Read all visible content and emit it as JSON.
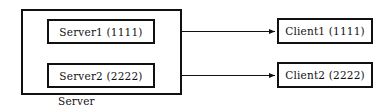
{
  "diagram": {
    "server_group": {
      "label": "Server",
      "nodes": [
        {
          "id": "server1",
          "label": "Server1 (1111)",
          "name": "Server1",
          "port": "1111"
        },
        {
          "id": "server2",
          "label": "Server2 (2222)",
          "name": "Server2",
          "port": "2222"
        }
      ]
    },
    "clients": [
      {
        "id": "client1",
        "label": "Client1 (1111)",
        "name": "Client1",
        "port": "1111"
      },
      {
        "id": "client2",
        "label": "Client2 (2222)",
        "name": "Client2",
        "port": "2222"
      }
    ],
    "connections": [
      {
        "id": "conn1",
        "from": "server1",
        "to": "client1",
        "style": "double-arrow",
        "port": "1111"
      },
      {
        "id": "conn2",
        "from": "server2",
        "to": "client2",
        "style": "double-arrow",
        "port": "2222"
      }
    ],
    "colors": {
      "stroke": "#111111",
      "fill": "#ffffff",
      "text": "#111111"
    }
  }
}
